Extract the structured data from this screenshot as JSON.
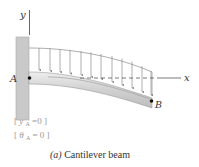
{
  "figure": {
    "caption_tag": "(a)",
    "caption_text": "Cantilever beam",
    "axes": {
      "y_label": "y",
      "x_label": "x"
    },
    "points": [
      {
        "name": "A",
        "label": "A"
      },
      {
        "name": "B",
        "label": "B"
      }
    ],
    "boundary_conditions": [
      {
        "open": "[",
        "var": "y",
        "sub": "A",
        "eq": "=0",
        "close": "]"
      },
      {
        "open": "[",
        "var": "θ",
        "sub": "A",
        "eq": "= 0",
        "close": "]"
      }
    ],
    "load": {
      "type": "distributed",
      "arrow_count": 12
    },
    "colors": {
      "wall": "#c9c9c9",
      "beam": "#d8d8d8",
      "beam_edge": "#9a9a9a",
      "load_line": "#8a8a8a",
      "axis": "#555555",
      "point": "#111111"
    }
  }
}
